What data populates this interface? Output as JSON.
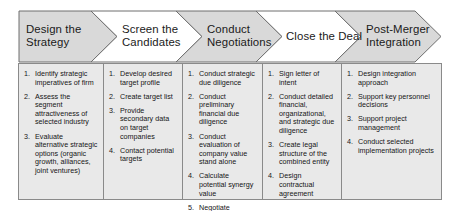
{
  "diagram": {
    "title_text": "M&A Process Stages",
    "colors": {
      "chevron_fill_shaded": "#d9d9d9",
      "chevron_fill_plain": "#ffffff",
      "chevron_stroke": "#6e6e6e",
      "body_fill": "#e9e9e9",
      "body_stroke": "#8a8a8a",
      "text": "#161616"
    },
    "stages": [
      {
        "id": "design-the-strategy",
        "label": "Design the\nStrategy",
        "shaded": true,
        "tasks": [
          "Identify strategic imperatives of firm",
          "Assess the segment attractiveness of selected industry",
          "Evaluate alternative strategic options (organic growth, alliances, joint ventures)"
        ]
      },
      {
        "id": "screen-the-candidates",
        "label": "Screen the\nCandidates",
        "shaded": false,
        "tasks": [
          "Develop desired target profile",
          "Create target list",
          "Provide secondary data on target companies",
          "Contact potential targets"
        ]
      },
      {
        "id": "conduct-negotiations",
        "label": "Conduct\nNegotiations",
        "shaded": true,
        "tasks": [
          "Conduct strategic due diligence",
          "Conduct preliminary financial due diligence",
          "Conduct evaluation of company value stand alone",
          "Calculate potential synergy value",
          "Negotiate contractual terms"
        ]
      },
      {
        "id": "close-the-deal",
        "label": "Close the Deal",
        "shaded": false,
        "tasks": [
          "Sign letter of intent",
          "Conduct detailed financial, organizational, and strategic due diligence",
          "Create legal structure of the combined entity",
          "Design contractual agreement"
        ]
      },
      {
        "id": "post-merger-integration",
        "label": "Post-Merger\nIntegration",
        "shaded": true,
        "tasks": [
          "Design integration approach",
          "Support key personnel decisions",
          "Support project management",
          "Conduct selected implementation projects"
        ]
      }
    ]
  }
}
